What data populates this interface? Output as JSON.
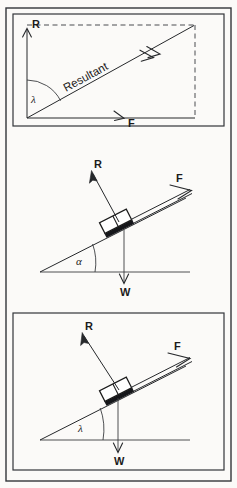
{
  "figure": {
    "background_color": "#fbfaf8",
    "ink_color": "#26282b",
    "panel_count": 3
  },
  "panel1": {
    "name": "resultant-parallelogram",
    "labels": {
      "reaction": "R",
      "force": "F",
      "resultant": "Resultant",
      "angle": "λ"
    },
    "description": "Vertical vector R and horizontal vector F combine into a diagonal Resultant; dashed lines complete the rectangle; angle lambda measured from vertical R to the Resultant",
    "angle_symbol_name": "lambda",
    "resultant_label_rotation_deg": -28
  },
  "panel2": {
    "name": "inclined-plane-alpha",
    "labels": {
      "reaction": "R",
      "force": "F",
      "weight": "W",
      "angle": "α"
    },
    "description": "Block resting on an incline; R normal to the slope, F acting up the slope as a double line, W acting vertically downward; incline angle alpha measured from the horizontal",
    "angle_symbol_name": "alpha"
  },
  "panel3": {
    "name": "inclined-plane-lambda",
    "labels": {
      "reaction": "R",
      "force": "F",
      "weight": "W",
      "angle": "λ"
    },
    "description": "Block resting on an incline; R normal to the slope, F acting up the slope as a double line, W acting vertically downward; incline angle lambda measured from the horizontal",
    "angle_symbol_name": "lambda"
  }
}
